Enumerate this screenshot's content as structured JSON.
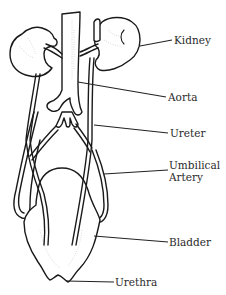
{
  "diagram": {
    "labels": {
      "kidney": "Kidney",
      "aorta": "Aorta",
      "ureter": "Ureter",
      "umbilical_artery_line1": "Umbilical",
      "umbilical_artery_line2": "Artery",
      "bladder": "Bladder",
      "urethra": "Urethra"
    },
    "colors": {
      "line": "#1a1a1a",
      "text": "#2a2a2a",
      "background": "#ffffff"
    }
  }
}
